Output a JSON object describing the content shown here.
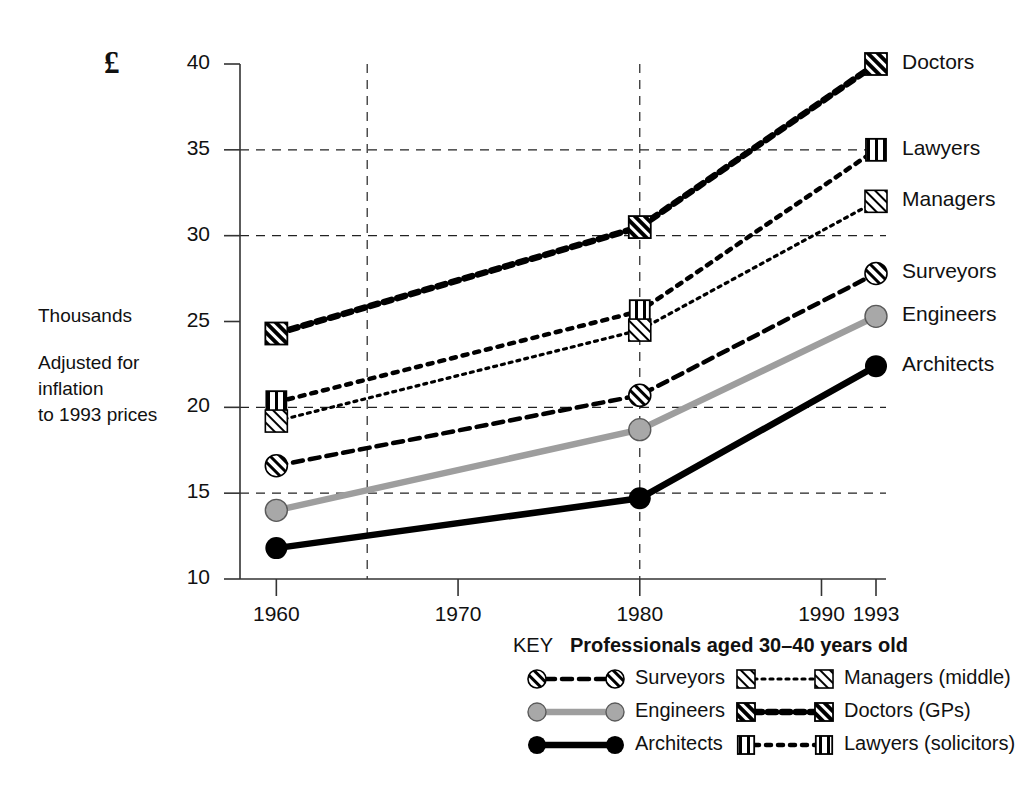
{
  "figure": {
    "currency_symbol": "£",
    "side_notes": [
      "Thousands",
      "Adjusted for",
      "inflation",
      "to 1993 prices"
    ],
    "y_axis": {
      "label": "£",
      "ticks": [
        10,
        15,
        20,
        25,
        30,
        35,
        40
      ],
      "min": 10,
      "max": 40,
      "gridlines_at": [
        15,
        20,
        30,
        35
      ]
    },
    "x_axis": {
      "ticks": [
        1960,
        1970,
        1980,
        1990,
        1993
      ],
      "min": 1958,
      "max": 1993,
      "gridlines_at": [
        1965,
        1980
      ]
    }
  },
  "key": {
    "word": "KEY",
    "title": "Professionals aged 30–40 years old",
    "entries": [
      {
        "label": "Surveyors",
        "marker": "circle-hatched",
        "line": "dashed",
        "color": "#000000",
        "column": 1
      },
      {
        "label": "Engineers",
        "marker": "circle-grey",
        "line": "solid",
        "color": "#9e9e9e",
        "column": 1
      },
      {
        "label": "Architects",
        "marker": "circle-black",
        "line": "solid",
        "color": "#000000",
        "column": 1
      },
      {
        "label": "Managers (middle)",
        "marker": "square-hatched-light",
        "line": "fine-dotted",
        "color": "#000000",
        "column": 2
      },
      {
        "label": "Doctors (GPs)",
        "marker": "square-hatched-bold",
        "line": "thick-dashed",
        "color": "#000000",
        "column": 2
      },
      {
        "label": "Lawyers (solicitors)",
        "marker": "square-vbars",
        "line": "dotted",
        "color": "#000000",
        "column": 2
      }
    ]
  },
  "right_labels": [
    {
      "name": "Doctors",
      "value": 40.0
    },
    {
      "name": "Lawyers",
      "value": 35.0
    },
    {
      "name": "Managers",
      "value": 32.0
    },
    {
      "name": "Surveyors",
      "value": 27.8
    },
    {
      "name": "Engineers",
      "value": 25.3
    },
    {
      "name": "Architects",
      "value": 22.4
    }
  ],
  "chart_data": {
    "type": "line",
    "title": "Professionals aged 30–40 years old",
    "xlabel": "",
    "ylabel": "£ Thousands — Adjusted for inflation to 1993 prices",
    "xlim": [
      1958,
      1993
    ],
    "ylim": [
      10,
      40
    ],
    "x": [
      1960,
      1980,
      1993
    ],
    "grid": true,
    "legend_position": "bottom",
    "series": [
      {
        "name": "Doctors (GPs)",
        "short": "Doctors",
        "values": [
          24.3,
          30.5,
          40.0
        ],
        "marker": "square-hatched-bold",
        "line": "thick-dashed",
        "color": "#000000"
      },
      {
        "name": "Lawyers (solicitors)",
        "short": "Lawyers",
        "values": [
          20.3,
          25.6,
          35.0
        ],
        "marker": "square-vbars",
        "line": "dotted",
        "color": "#000000"
      },
      {
        "name": "Managers (middle)",
        "short": "Managers",
        "values": [
          19.2,
          24.5,
          32.0
        ],
        "marker": "square-hatched-light",
        "line": "fine-dotted",
        "color": "#000000"
      },
      {
        "name": "Surveyors",
        "short": "Surveyors",
        "values": [
          16.6,
          20.7,
          27.8
        ],
        "marker": "circle-hatched",
        "line": "dashed",
        "color": "#000000"
      },
      {
        "name": "Engineers",
        "short": "Engineers",
        "values": [
          14.0,
          18.7,
          25.3
        ],
        "marker": "circle-grey",
        "line": "solid",
        "color": "#9e9e9e"
      },
      {
        "name": "Architects",
        "short": "Architects",
        "values": [
          11.8,
          14.7,
          22.4
        ],
        "marker": "circle-black",
        "line": "solid",
        "color": "#000000"
      }
    ]
  }
}
